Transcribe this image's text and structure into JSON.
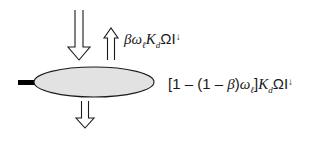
{
  "diagram": {
    "type": "energy-balance-schematic",
    "colors": {
      "ellipse_fill": "#e2e2e2",
      "stroke": "#1a1a1a",
      "stem": "#000000",
      "background": "#ffffff"
    },
    "elements": [
      {
        "id": "incoming-arrow",
        "shape": "hollow-arrow",
        "direction": "down"
      },
      {
        "id": "reflected-arrow",
        "shape": "hollow-arrow",
        "direction": "up"
      },
      {
        "id": "transmitted-arrow",
        "shape": "hollow-arrow",
        "direction": "down"
      },
      {
        "id": "leaf-ellipse",
        "shape": "ellipse"
      },
      {
        "id": "petiole-stem",
        "shape": "bar"
      }
    ],
    "labels": {
      "reflected": {
        "beta": "β",
        "omega": "ω",
        "omega_sub": "ℓ",
        "K": "K",
        "K_sub": "d",
        "Omega_I": "ΩI",
        "arrow": "↓"
      },
      "absorbed": {
        "prefix": "[1 – (1 – ",
        "beta": "β",
        "mid": ")",
        "omega": "ω",
        "omega_sub": "ℓ",
        "close": "]",
        "K": "K",
        "K_sub": "d",
        "Omega_I": "ΩI",
        "arrow": "↓"
      }
    }
  }
}
